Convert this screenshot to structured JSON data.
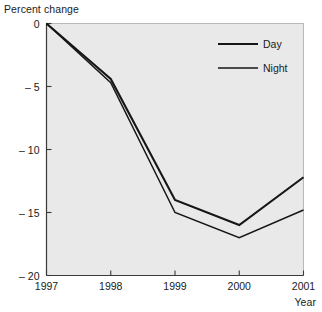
{
  "chart_data": {
    "type": "line",
    "title": "",
    "xlabel": "Year",
    "ylabel": "Percent change",
    "x": [
      1997,
      1998,
      1999,
      2000,
      2001
    ],
    "xticklabels": [
      "1997",
      "1998",
      "1999",
      "2000",
      "2001"
    ],
    "yticks": [
      0,
      -5,
      -10,
      -15,
      -20
    ],
    "yticklabels": [
      "0",
      "– 5",
      "– 10",
      "– 15",
      "– 20"
    ],
    "ylim": [
      -20,
      0
    ],
    "xlim": [
      1997,
      2001
    ],
    "grid": false,
    "legend_position": "top-right",
    "series": [
      {
        "name": "Day",
        "values": [
          0,
          -4.4,
          -14.0,
          -16.0,
          -12.2
        ],
        "color": "#161616",
        "line_width": 2.1
      },
      {
        "name": "Night",
        "values": [
          0,
          -4.7,
          -15.0,
          -17.0,
          -14.8
        ],
        "color": "#161616",
        "line_width": 1.5
      }
    ]
  },
  "colors": {
    "plot_background": "#e9e9e9",
    "plot_border": "#b9b9b9",
    "axis": "#3a3a3a",
    "text": "#1a1a1a",
    "line": "#161616"
  },
  "legend": {
    "entries": [
      {
        "label": "Day"
      },
      {
        "label": "Night"
      }
    ]
  }
}
